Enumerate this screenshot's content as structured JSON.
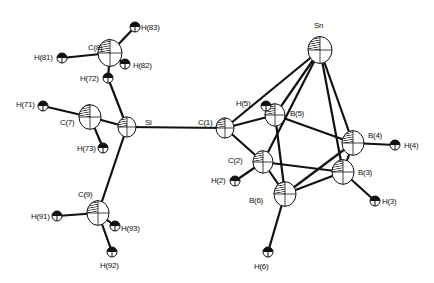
{
  "diagram": {
    "type": "ORTEP molecular structure",
    "atoms": [
      {
        "id": "Sn",
        "label": "Sn",
        "x": 320,
        "y": 50,
        "r": 12,
        "type": "heavy",
        "lx": 314,
        "ly": 28
      },
      {
        "id": "Si",
        "label": "Si",
        "x": 127,
        "y": 127,
        "r": 9,
        "type": "heavy",
        "lx": 145,
        "ly": 125
      },
      {
        "id": "C8",
        "label": "C(8)",
        "x": 110,
        "y": 53,
        "r": 12,
        "type": "carbon",
        "lx": 88,
        "ly": 50
      },
      {
        "id": "C7",
        "label": "C(7)",
        "x": 90,
        "y": 117,
        "r": 11,
        "type": "carbon",
        "lx": 60,
        "ly": 125
      },
      {
        "id": "C9",
        "label": "C(9)",
        "x": 98,
        "y": 213,
        "r": 11,
        "type": "carbon",
        "lx": 78,
        "ly": 197
      },
      {
        "id": "C1",
        "label": "C(1)",
        "x": 225,
        "y": 128,
        "r": 9,
        "type": "carbon",
        "lx": 198,
        "ly": 125
      },
      {
        "id": "C2",
        "label": "C(2)",
        "x": 263,
        "y": 162,
        "r": 10,
        "type": "carbon",
        "lx": 228,
        "ly": 163
      },
      {
        "id": "B5",
        "label": "B(5)",
        "x": 275,
        "y": 115,
        "r": 10,
        "type": "boron",
        "lx": 290,
        "ly": 116
      },
      {
        "id": "B4",
        "label": "B(4)",
        "x": 353,
        "y": 143,
        "r": 11,
        "type": "boron",
        "lx": 368,
        "ly": 138
      },
      {
        "id": "B3",
        "label": "B(3)",
        "x": 343,
        "y": 172,
        "r": 11,
        "type": "boron",
        "lx": 358,
        "ly": 175
      },
      {
        "id": "B6",
        "label": "B(6)",
        "x": 285,
        "y": 194,
        "r": 11,
        "type": "boron",
        "lx": 249,
        "ly": 203
      },
      {
        "id": "H83",
        "label": "H(83)",
        "x": 135,
        "y": 27,
        "r": 5,
        "type": "hydrogen",
        "lx": 141,
        "ly": 30
      },
      {
        "id": "H81",
        "label": "H(81)",
        "x": 62,
        "y": 58,
        "r": 5,
        "type": "hydrogen",
        "lx": 34,
        "ly": 60
      },
      {
        "id": "H82",
        "label": "H(82)",
        "x": 125,
        "y": 64,
        "r": 5,
        "type": "hydrogen",
        "lx": 133,
        "ly": 68
      },
      {
        "id": "H72",
        "label": "H(72)",
        "x": 108,
        "y": 78,
        "r": 5,
        "type": "hydrogen",
        "lx": 80,
        "ly": 81
      },
      {
        "id": "H71",
        "label": "H(71)",
        "x": 43,
        "y": 106,
        "r": 5,
        "type": "hydrogen",
        "lx": 16,
        "ly": 107
      },
      {
        "id": "H73",
        "label": "H(73)",
        "x": 103,
        "y": 148,
        "r": 5,
        "type": "hydrogen",
        "lx": 77,
        "ly": 151
      },
      {
        "id": "H91",
        "label": "H(91)",
        "x": 57,
        "y": 216,
        "r": 5,
        "type": "hydrogen",
        "lx": 31,
        "ly": 219
      },
      {
        "id": "H93",
        "label": "H(93)",
        "x": 115,
        "y": 226,
        "r": 5,
        "type": "hydrogen",
        "lx": 121,
        "ly": 231
      },
      {
        "id": "H92",
        "label": "H(92)",
        "x": 112,
        "y": 252,
        "r": 5,
        "type": "hydrogen",
        "lx": 100,
        "ly": 268
      },
      {
        "id": "H5",
        "label": "H(5)",
        "x": 266,
        "y": 106,
        "r": 5,
        "type": "hydrogen",
        "lx": 236,
        "ly": 106
      },
      {
        "id": "H2",
        "label": "H(2)",
        "x": 235,
        "y": 181,
        "r": 5,
        "type": "hydrogen",
        "lx": 211,
        "ly": 183
      },
      {
        "id": "H4",
        "label": "H(4)",
        "x": 395,
        "y": 145,
        "r": 5,
        "type": "hydrogen",
        "lx": 404,
        "ly": 148
      },
      {
        "id": "H3",
        "label": "H(3)",
        "x": 375,
        "y": 201,
        "r": 5,
        "type": "hydrogen",
        "lx": 382,
        "ly": 204
      },
      {
        "id": "H6",
        "label": "H(6)",
        "x": 268,
        "y": 252,
        "r": 5,
        "type": "hydrogen",
        "lx": 254,
        "ly": 269
      }
    ],
    "bonds": [
      [
        "Si",
        "C1"
      ],
      [
        "Si",
        "C7"
      ],
      [
        "Si",
        "C9"
      ],
      [
        "Si",
        "H72"
      ],
      [
        "C8",
        "H83"
      ],
      [
        "C8",
        "H81"
      ],
      [
        "C8",
        "H82"
      ],
      [
        "C8",
        "H72"
      ],
      [
        "C7",
        "H71"
      ],
      [
        "C7",
        "H73"
      ],
      [
        "C9",
        "H91"
      ],
      [
        "C9",
        "H93"
      ],
      [
        "C9",
        "H92"
      ],
      [
        "C1",
        "C2"
      ],
      [
        "C1",
        "B5"
      ],
      [
        "C1",
        "Sn"
      ],
      [
        "Sn",
        "B5"
      ],
      [
        "Sn",
        "C2"
      ],
      [
        "Sn",
        "B4"
      ],
      [
        "Sn",
        "B3"
      ],
      [
        "B5",
        "H5"
      ],
      [
        "B5",
        "B4"
      ],
      [
        "B5",
        "B6"
      ],
      [
        "C2",
        "B6"
      ],
      [
        "C2",
        "B3"
      ],
      [
        "C2",
        "H2"
      ],
      [
        "B4",
        "B3"
      ],
      [
        "B4",
        "H4"
      ],
      [
        "B4",
        "B6"
      ],
      [
        "B3",
        "B6"
      ],
      [
        "B3",
        "H3"
      ],
      [
        "B6",
        "H6"
      ]
    ]
  }
}
